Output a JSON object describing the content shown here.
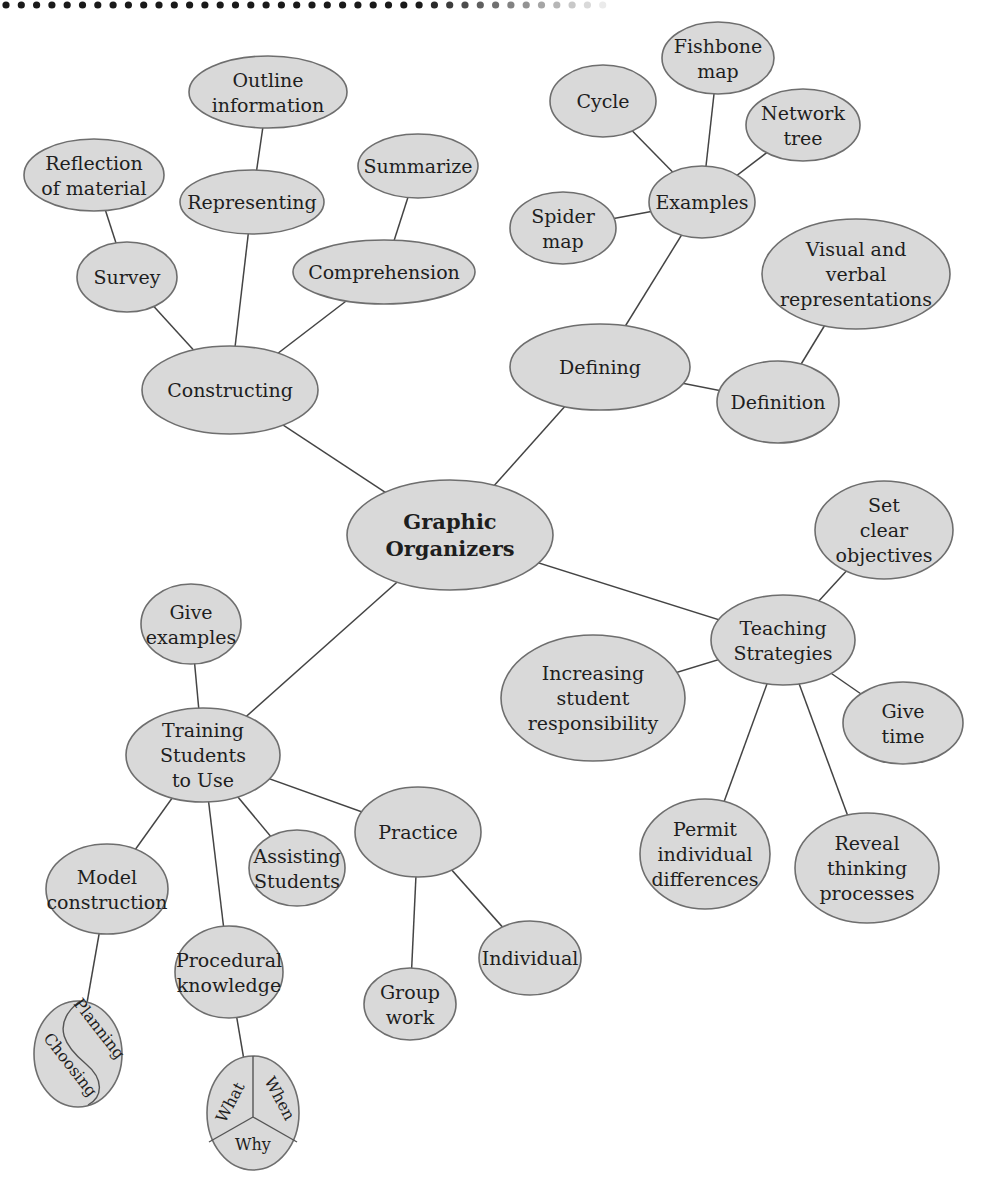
{
  "colors": {
    "node_fill": "#d9d9d9",
    "node_stroke": "#6e6e6e",
    "edge": "#444444",
    "text": "#1e1e1e",
    "dots": "#1a1a1a"
  },
  "nodes": [
    {
      "id": "root",
      "lines": [
        "Graphic",
        "Organizers"
      ],
      "cx": 450,
      "cy": 535,
      "rx": 103,
      "ry": 55,
      "bold": true
    },
    {
      "id": "constructing",
      "lines": [
        "Constructing"
      ],
      "cx": 230,
      "cy": 390,
      "rx": 88,
      "ry": 44
    },
    {
      "id": "survey",
      "lines": [
        "Survey"
      ],
      "cx": 127,
      "cy": 277,
      "rx": 50,
      "ry": 35
    },
    {
      "id": "reflection",
      "lines": [
        "Reflection",
        "of material"
      ],
      "cx": 94,
      "cy": 175,
      "rx": 70,
      "ry": 36
    },
    {
      "id": "representing",
      "lines": [
        "Representing"
      ],
      "cx": 252,
      "cy": 202,
      "rx": 72,
      "ry": 32
    },
    {
      "id": "outline",
      "lines": [
        "Outline",
        "information"
      ],
      "cx": 268,
      "cy": 92,
      "rx": 79,
      "ry": 36
    },
    {
      "id": "comprehension",
      "lines": [
        "Comprehension"
      ],
      "cx": 384,
      "cy": 272,
      "rx": 91,
      "ry": 32
    },
    {
      "id": "summarize",
      "lines": [
        "Summarize"
      ],
      "cx": 418,
      "cy": 166,
      "rx": 60,
      "ry": 32
    },
    {
      "id": "defining",
      "lines": [
        "Defining"
      ],
      "cx": 600,
      "cy": 367,
      "rx": 90,
      "ry": 43
    },
    {
      "id": "examples",
      "lines": [
        "Examples"
      ],
      "cx": 702,
      "cy": 202,
      "rx": 53,
      "ry": 36
    },
    {
      "id": "cycle",
      "lines": [
        "Cycle"
      ],
      "cx": 603,
      "cy": 101,
      "rx": 53,
      "ry": 36
    },
    {
      "id": "fishbone",
      "lines": [
        "Fishbone",
        "map"
      ],
      "cx": 718,
      "cy": 58,
      "rx": 56,
      "ry": 36
    },
    {
      "id": "network",
      "lines": [
        "Network",
        "tree"
      ],
      "cx": 803,
      "cy": 125,
      "rx": 57,
      "ry": 36
    },
    {
      "id": "spider",
      "lines": [
        "Spider",
        "map"
      ],
      "cx": 563,
      "cy": 228,
      "rx": 53,
      "ry": 36
    },
    {
      "id": "visual",
      "lines": [
        "Visual and",
        "verbal",
        "representations"
      ],
      "cx": 856,
      "cy": 274,
      "rx": 94,
      "ry": 55
    },
    {
      "id": "definition",
      "lines": [
        "Definition"
      ],
      "cx": 778,
      "cy": 402,
      "rx": 61,
      "ry": 41
    },
    {
      "id": "teaching",
      "lines": [
        "Teaching",
        "Strategies"
      ],
      "cx": 783,
      "cy": 640,
      "rx": 72,
      "ry": 45
    },
    {
      "id": "objectives",
      "lines": [
        "Set",
        "clear",
        "objectives"
      ],
      "cx": 884,
      "cy": 530,
      "rx": 69,
      "ry": 49
    },
    {
      "id": "increasing",
      "lines": [
        "Increasing",
        "student",
        "responsibility"
      ],
      "cx": 593,
      "cy": 698,
      "rx": 92,
      "ry": 63
    },
    {
      "id": "givetime",
      "lines": [
        "Give",
        "time"
      ],
      "cx": 903,
      "cy": 723,
      "rx": 60,
      "ry": 41
    },
    {
      "id": "permit",
      "lines": [
        "Permit",
        "individual",
        "differences"
      ],
      "cx": 705,
      "cy": 854,
      "rx": 65,
      "ry": 55
    },
    {
      "id": "reveal",
      "lines": [
        "Reveal",
        "thinking",
        "processes"
      ],
      "cx": 867,
      "cy": 868,
      "rx": 72,
      "ry": 55
    },
    {
      "id": "training",
      "lines": [
        "Training",
        "Students",
        "to Use"
      ],
      "cx": 203,
      "cy": 755,
      "rx": 77,
      "ry": 47
    },
    {
      "id": "giveexamples",
      "lines": [
        "Give",
        "examples"
      ],
      "cx": 191,
      "cy": 624,
      "rx": 50,
      "ry": 40
    },
    {
      "id": "model",
      "lines": [
        "Model",
        "construction"
      ],
      "cx": 107,
      "cy": 889,
      "rx": 61,
      "ry": 45
    },
    {
      "id": "assisting",
      "lines": [
        "Assisting",
        "Students"
      ],
      "cx": 297,
      "cy": 868,
      "rx": 48,
      "ry": 38
    },
    {
      "id": "practice",
      "lines": [
        "Practice"
      ],
      "cx": 418,
      "cy": 832,
      "rx": 63,
      "ry": 45
    },
    {
      "id": "procedural",
      "lines": [
        "Procedural",
        "knowledge"
      ],
      "cx": 229,
      "cy": 972,
      "rx": 54,
      "ry": 46
    },
    {
      "id": "groupwork",
      "lines": [
        "Group",
        "work"
      ],
      "cx": 410,
      "cy": 1004,
      "rx": 46,
      "ry": 36
    },
    {
      "id": "individual",
      "lines": [
        "Individual"
      ],
      "cx": 530,
      "cy": 958,
      "rx": 51,
      "ry": 37
    }
  ],
  "special_nodes": {
    "choosing_planning": {
      "cx": 78,
      "cy": 1054,
      "rx": 44,
      "ry": 53,
      "labels": [
        "Planning",
        "Choosing"
      ]
    },
    "what_when_why": {
      "cx": 253,
      "cy": 1113,
      "rx": 46,
      "ry": 57,
      "labels": [
        "What",
        "When",
        "Why"
      ]
    }
  },
  "edges": [
    [
      "root",
      "constructing"
    ],
    [
      "root",
      "defining"
    ],
    [
      "root",
      "teaching"
    ],
    [
      "root",
      "training"
    ],
    [
      "constructing",
      "survey"
    ],
    [
      "constructing",
      "representing"
    ],
    [
      "constructing",
      "comprehension"
    ],
    [
      "survey",
      "reflection"
    ],
    [
      "representing",
      "outline"
    ],
    [
      "comprehension",
      "summarize"
    ],
    [
      "defining",
      "examples"
    ],
    [
      "defining",
      "definition"
    ],
    [
      "examples",
      "cycle"
    ],
    [
      "examples",
      "fishbone"
    ],
    [
      "examples",
      "network"
    ],
    [
      "examples",
      "spider"
    ],
    [
      "definition",
      "visual"
    ],
    [
      "teaching",
      "objectives"
    ],
    [
      "teaching",
      "increasing"
    ],
    [
      "teaching",
      "givetime"
    ],
    [
      "teaching",
      "permit"
    ],
    [
      "teaching",
      "reveal"
    ],
    [
      "training",
      "giveexamples"
    ],
    [
      "training",
      "model"
    ],
    [
      "training",
      "assisting"
    ],
    [
      "training",
      "practice"
    ],
    [
      "training",
      "procedural"
    ],
    [
      "practice",
      "groupwork"
    ],
    [
      "practice",
      "individual"
    ],
    [
      "model",
      "choosing_planning"
    ],
    [
      "procedural",
      "what_when_why"
    ]
  ]
}
